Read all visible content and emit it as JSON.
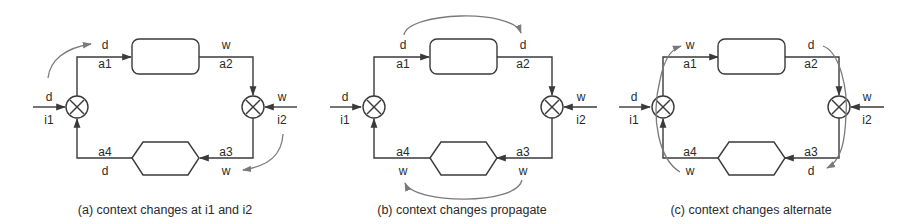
{
  "figure": {
    "panels": [
      {
        "id": "a",
        "caption": "(a) context changes at i1 and i2",
        "labels": {
          "in_left_top": "d",
          "in_left_bottom": "i1",
          "in_right_top": "w",
          "in_right_bottom": "i2",
          "a1_top": "d",
          "a1": "a1",
          "a2_top": "w",
          "a2": "a2",
          "a3": "a3",
          "a3_bottom": "w",
          "a4": "a4",
          "a4_bottom": "d"
        }
      },
      {
        "id": "b",
        "caption": "(b) context changes propagate",
        "labels": {
          "in_left_top": "d",
          "in_left_bottom": "i1",
          "in_right_top": "w",
          "in_right_bottom": "i2",
          "a1_top": "d",
          "a1": "a1",
          "a2_top": "d",
          "a2": "a2",
          "a3": "a3",
          "a3_bottom": "w",
          "a4": "a4",
          "a4_bottom": "w"
        }
      },
      {
        "id": "c",
        "caption": "(c) context changes alternate",
        "labels": {
          "in_left_top": "d",
          "in_left_bottom": "i1",
          "in_right_top": "w",
          "in_right_bottom": "i2",
          "a1_top": "w",
          "a1": "a1",
          "a2_top": "d",
          "a2": "a2",
          "a3": "a3",
          "a3_bottom": "d",
          "a4": "a4",
          "a4_bottom": "w"
        }
      }
    ],
    "colors": {
      "wire": "#3a3a3a",
      "context_arrow": "#7a7a7a"
    }
  }
}
